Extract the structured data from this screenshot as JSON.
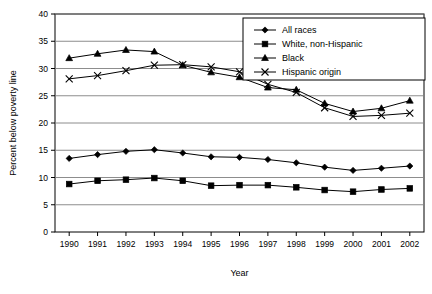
{
  "chart_data": {
    "type": "line",
    "title": "",
    "xlabel": "Year",
    "ylabel": "Percent below poverty line",
    "categories": [
      "1990",
      "1991",
      "1992",
      "1993",
      "1994",
      "1995",
      "1996",
      "1997",
      "1998",
      "1999",
      "2000",
      "2001",
      "2002"
    ],
    "xlim": [
      1990,
      2002
    ],
    "ylim": [
      0,
      40
    ],
    "yticks": [
      "0",
      "5",
      "10",
      "15",
      "20",
      "25",
      "30",
      "35",
      "40"
    ],
    "grid": "horizontal",
    "legend_position": "top-right",
    "series": [
      {
        "name": "All races",
        "marker": "diamond",
        "values": [
          13.5,
          14.2,
          14.8,
          15.1,
          14.5,
          13.8,
          13.7,
          13.3,
          12.7,
          11.9,
          11.3,
          11.7,
          12.1
        ]
      },
      {
        "name": "White, non-Hispanic",
        "marker": "square",
        "values": [
          8.8,
          9.4,
          9.6,
          9.9,
          9.4,
          8.5,
          8.6,
          8.6,
          8.2,
          7.7,
          7.4,
          7.8,
          8.0
        ]
      },
      {
        "name": "Black",
        "marker": "triangle",
        "values": [
          31.9,
          32.7,
          33.4,
          33.1,
          30.6,
          29.3,
          28.4,
          26.5,
          26.1,
          23.6,
          22.1,
          22.7,
          24.1
        ]
      },
      {
        "name": "Hispanic origin",
        "marker": "cross",
        "values": [
          28.1,
          28.7,
          29.6,
          30.6,
          30.7,
          30.3,
          29.4,
          27.1,
          25.6,
          22.8,
          21.2,
          21.4,
          21.8
        ]
      }
    ]
  },
  "legend": {
    "items": [
      {
        "label": "All races"
      },
      {
        "label": "White, non-Hispanic"
      },
      {
        "label": "Black"
      },
      {
        "label": "Hispanic origin"
      }
    ]
  }
}
